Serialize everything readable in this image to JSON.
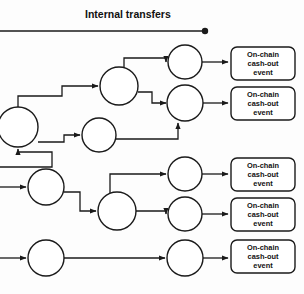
{
  "diagram": {
    "title": "Internal transfers",
    "header": {
      "label": "Internal transfers",
      "line_end_marker": "filled-dot",
      "line_x1": 0,
      "line_x2": 205,
      "line_y": 31,
      "dot_x": 205,
      "dot_y": 31,
      "label_x": 85,
      "label_y": 18
    },
    "colors": {
      "stroke": "#1a1a1a",
      "node_fill": "#ffffff",
      "text": "#111111",
      "background": "#fdfdfd"
    },
    "node_label": "",
    "event_box_text_lines": [
      "On-chain",
      "cash-out",
      "event"
    ],
    "nodes": [
      {
        "id": "n1",
        "cx": 18,
        "cy": 127,
        "r": 20,
        "name": "wallet-node-1"
      },
      {
        "id": "n2",
        "cx": 99,
        "cy": 135,
        "r": 17,
        "name": "wallet-node-2"
      },
      {
        "id": "n3",
        "cx": 119,
        "cy": 86,
        "r": 19,
        "name": "wallet-node-3"
      },
      {
        "id": "n4",
        "cx": 185,
        "cy": 62,
        "r": 17,
        "name": "wallet-node-4"
      },
      {
        "id": "n5",
        "cx": 185,
        "cy": 103,
        "r": 18,
        "name": "wallet-node-5"
      },
      {
        "id": "n6",
        "cx": 46,
        "cy": 187,
        "r": 18,
        "name": "wallet-node-6"
      },
      {
        "id": "n7",
        "cx": 117,
        "cy": 211,
        "r": 19,
        "name": "wallet-node-7"
      },
      {
        "id": "n8",
        "cx": 185,
        "cy": 174,
        "r": 17,
        "name": "wallet-node-8"
      },
      {
        "id": "n9",
        "cx": 185,
        "cy": 214,
        "r": 17,
        "name": "wallet-node-9"
      },
      {
        "id": "n10",
        "cx": 46,
        "cy": 258,
        "r": 18,
        "name": "wallet-node-10"
      },
      {
        "id": "n11",
        "cx": 185,
        "cy": 258,
        "r": 18,
        "name": "wallet-node-11"
      }
    ],
    "event_boxes": [
      {
        "id": "e1",
        "x": 231,
        "y": 47,
        "w": 64,
        "h": 33,
        "name": "on-chain-cash-out-event-1"
      },
      {
        "id": "e2",
        "x": 231,
        "y": 87,
        "w": 64,
        "h": 33,
        "name": "on-chain-cash-out-event-2"
      },
      {
        "id": "e3",
        "x": 231,
        "y": 158,
        "w": 64,
        "h": 33,
        "name": "on-chain-cash-out-event-3"
      },
      {
        "id": "e4",
        "x": 231,
        "y": 198,
        "w": 64,
        "h": 33,
        "name": "on-chain-cash-out-event-4"
      },
      {
        "id": "e5",
        "x": 231,
        "y": 240,
        "w": 64,
        "h": 33,
        "name": "on-chain-cash-out-event-5"
      }
    ],
    "edges": [
      {
        "id": "ed1",
        "name": "edge-inflow-to-node1",
        "d": "M 0 167 L 52 167 L 52 152 L 18 152 L 18 149",
        "arrow": true
      },
      {
        "id": "ed2",
        "name": "edge-node1-to-node3",
        "d": "M 18 107 L 18 96 L 62 96 L 62 86 L 98 86",
        "arrow": true
      },
      {
        "id": "ed3",
        "name": "edge-node1-to-node2",
        "d": "M 38 142 L 64 142 L 64 135 L 80 135",
        "arrow": true
      },
      {
        "id": "ed4",
        "name": "edge-node3-to-node4",
        "d": "M 124 68 L 124 58 L 166 58 L 166 62",
        "arrow": true
      },
      {
        "id": "ed5",
        "name": "edge-node3-to-node5",
        "d": "M 138 92 L 152 92 L 152 103 L 166 103",
        "arrow": true
      },
      {
        "id": "ed6",
        "name": "edge-node2-to-node5",
        "d": "M 116 139 L 178 139 L 178 123",
        "arrow": true
      },
      {
        "id": "ed7",
        "name": "edge-node4-to-event1",
        "d": "M 202 62 L 228 62",
        "arrow": true
      },
      {
        "id": "ed8",
        "name": "edge-node5-to-event2",
        "d": "M 203 103 L 228 103",
        "arrow": true
      },
      {
        "id": "ed9",
        "name": "edge-inflow-to-node6",
        "d": "M 0 187 L 26 187",
        "arrow": true
      },
      {
        "id": "ed10",
        "name": "edge-node6-to-node7",
        "d": "M 64 192 L 80 192 L 80 211 L 96 211",
        "arrow": true
      },
      {
        "id": "ed11",
        "name": "edge-node7-to-node8",
        "d": "M 110 193 L 110 174 L 166 174",
        "arrow": true
      },
      {
        "id": "ed12",
        "name": "edge-node7-to-node9",
        "d": "M 136 211 L 166 211 L 166 214",
        "arrow": true
      },
      {
        "id": "ed13",
        "name": "edge-node8-to-event3",
        "d": "M 202 174 L 228 174",
        "arrow": true
      },
      {
        "id": "ed14",
        "name": "edge-node9-to-event4",
        "d": "M 202 214 L 228 214",
        "arrow": true
      },
      {
        "id": "ed15",
        "name": "edge-inflow-to-node10",
        "d": "M 0 258 L 26 258",
        "arrow": true
      },
      {
        "id": "ed16",
        "name": "edge-node10-to-node11",
        "d": "M 64 258 L 165 258",
        "arrow": true
      },
      {
        "id": "ed17",
        "name": "edge-node11-to-event5",
        "d": "M 203 258 L 228 258",
        "arrow": true
      }
    ]
  }
}
